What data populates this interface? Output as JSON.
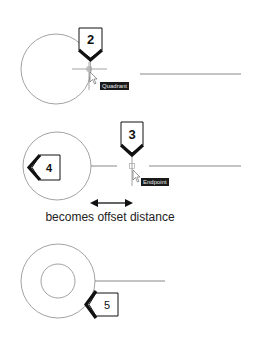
{
  "diagram": {
    "step1": {
      "callout_number": "2",
      "snap_tooltip": "Quadrant"
    },
    "step2": {
      "callout_number_a": "3",
      "callout_number_b": "4",
      "snap_tooltip": "Endpoint",
      "caption": "becomes offset distance"
    },
    "step3": {
      "callout_number": "5"
    },
    "colors": {
      "geometry": "#8a8a8a",
      "callout_arrow": "#111111",
      "tooltip_bg": "#1a1a1a",
      "tooltip_text": "#e8e8e8"
    }
  }
}
